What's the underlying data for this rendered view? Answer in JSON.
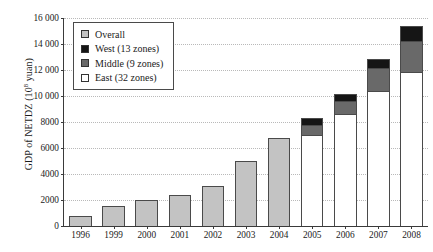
{
  "chart_data": {
    "type": "bar",
    "title": "",
    "subtitle": "",
    "xlabel": "",
    "ylabel": "GDP of NETDZ (10⁸ yuan)",
    "ylabel_prefix": "GDP of NETDZ (10",
    "ylabel_exponent": "8",
    "ylabel_suffix": " yuan)",
    "grid": true,
    "legend_position": "top-left",
    "stacked": true,
    "ylim": [
      0,
      16000
    ],
    "ytick_values": [
      0,
      2000,
      4000,
      6000,
      8000,
      10000,
      12000,
      14000,
      16000
    ],
    "ytick_labels": [
      "0",
      "2000",
      "4000",
      "6000",
      "8000",
      "10 000",
      "12 000",
      "14 000",
      "16 000"
    ],
    "categories": [
      "1996",
      "1999",
      "2000",
      "2001",
      "2002",
      "2003",
      "2004",
      "2005",
      "2006",
      "2007",
      "2008"
    ],
    "series": [
      {
        "name": "Overall",
        "color": "#c3c3c3",
        "values": [
          800,
          1500,
          2000,
          2400,
          3050,
          4950,
          6700,
          null,
          null,
          null,
          null
        ]
      },
      {
        "name": "East (32 zones)",
        "color": "#ffffff",
        "values": [
          null,
          null,
          null,
          null,
          null,
          null,
          null,
          6950,
          8600,
          10300,
          11800
        ]
      },
      {
        "name": "Middle (9 zones)",
        "color": "#696969",
        "values": [
          null,
          null,
          null,
          null,
          null,
          null,
          null,
          800,
          1000,
          1800,
          2400
        ]
      },
      {
        "name": "West (13 zones)",
        "color": "#151515",
        "values": [
          null,
          null,
          null,
          null,
          null,
          null,
          null,
          500,
          500,
          700,
          1100
        ]
      }
    ],
    "totals": [
      800,
      1500,
      2000,
      2400,
      3050,
      4950,
      6700,
      8250,
      10100,
      12800,
      15300
    ],
    "legend": [
      {
        "label": "Overall",
        "color": "#c3c3c3",
        "swatch": "overall"
      },
      {
        "label": "West (13 zones)",
        "color": "#151515",
        "swatch": "west"
      },
      {
        "label": "Middle (9 zones)",
        "color": "#696969",
        "swatch": "middle"
      },
      {
        "label": "East (32 zones)",
        "color": "#ffffff",
        "swatch": "east"
      }
    ]
  }
}
